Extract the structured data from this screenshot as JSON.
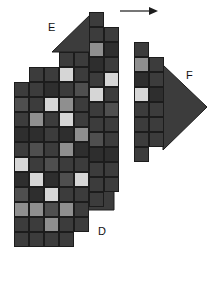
{
  "figure": {
    "title": "",
    "background_color": "#ffffff",
    "width": 214,
    "height": 303,
    "palette": {
      "dark": "#3c3c3c",
      "darker": "#2e2e2e",
      "mid": "#4f4f4f",
      "gray": "#8f8f8f",
      "light": "#d6d6d6",
      "lighter": "#e2e2e2",
      "outline": "#1c1c1c"
    }
  },
  "labels": [
    {
      "id": "label-e",
      "text": "E",
      "x": 48,
      "y": 22
    },
    {
      "id": "label-f",
      "text": "F",
      "x": 186,
      "y": 70
    },
    {
      "id": "label-d",
      "text": "D",
      "x": 98,
      "y": 226
    }
  ],
  "arrow": {
    "id": "direction-arrow",
    "label": "",
    "x": 120,
    "y": 5,
    "width": 38,
    "height": 12,
    "color": "#1c1c1c",
    "direction": "right"
  },
  "wedges": [
    {
      "id": "wedge-e-top",
      "points": "52,52 93,12 93,52",
      "color": "#3c3c3c"
    },
    {
      "id": "wedge-d-bottom",
      "points": "59,210 114,155 114,210",
      "color": "#3c3c3c"
    },
    {
      "id": "wedge-f-right",
      "points": "163,65 207,107 163,150",
      "color": "#3c3c3c"
    }
  ],
  "chart_data": {
    "type": "heatmap",
    "title": "",
    "xlabel": "",
    "ylabel": "",
    "grid": false,
    "legend_position": "none",
    "cell_width": 15,
    "cell_height": 15,
    "value_colors": {
      "1": "#2e2e2e",
      "2": "#3c3c3c",
      "3": "#4f4f4f",
      "4": "#8f8f8f",
      "5": "#d6d6d6",
      "6": "#e2e2e2"
    },
    "groups": [
      {
        "name": "E-D",
        "columns": [
          {
            "x": 14,
            "y": 82,
            "values": [
              2,
              3,
              2,
              1,
              2,
              5,
              1,
              3,
              4,
              2,
              2
            ]
          },
          {
            "x": 29,
            "y": 67,
            "values": [
              2,
              2,
              2,
              4,
              1,
              3,
              2,
              5,
              1,
              4,
              2,
              2
            ]
          },
          {
            "x": 44,
            "y": 67,
            "values": [
              2,
              1,
              5,
              2,
              2,
              2,
              3,
              1,
              5,
              3,
              4,
              2
            ]
          },
          {
            "x": 59,
            "y": 52,
            "values": [
              2,
              5,
              2,
              4,
              5,
              1,
              4,
              2,
              3,
              2,
              4,
              2,
              2
            ]
          },
          {
            "x": 74,
            "y": 52,
            "values": [
              2,
              2,
              3,
              2,
              2,
              4,
              1,
              2,
              5,
              2,
              2,
              2
            ]
          },
          {
            "x": 89,
            "y": 12,
            "values": [
              2,
              2,
              4,
              1,
              2,
              5,
              2,
              2,
              3,
              1,
              2,
              2,
              2
            ]
          },
          {
            "x": 104,
            "y": 27,
            "values": [
              2,
              1,
              2,
              5,
              2,
              3,
              2,
              2,
              1,
              2,
              2
            ]
          }
        ]
      },
      {
        "name": "F",
        "columns": [
          {
            "x": 134,
            "y": 42,
            "values": [
              2,
              4,
              1,
              5,
              2,
              2,
              2,
              2
            ]
          },
          {
            "x": 149,
            "y": 57,
            "values": [
              2,
              2,
              1,
              2,
              2,
              2
            ]
          }
        ]
      }
    ]
  }
}
